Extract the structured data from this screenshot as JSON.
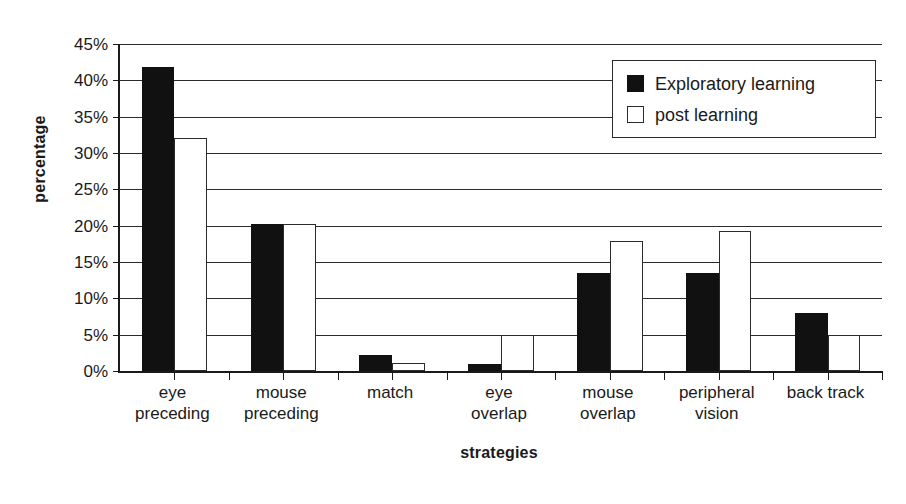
{
  "chart_data": {
    "type": "bar",
    "title": "",
    "xlabel": "strategies",
    "ylabel": "percentage",
    "categories": [
      "eye preceding",
      "mouse preceding",
      "match",
      "eye overlap",
      "mouse overlap",
      "peripheral vision",
      "back track"
    ],
    "category_lines": [
      [
        "eye",
        "preceding"
      ],
      [
        "mouse",
        "preceding"
      ],
      [
        "match",
        ""
      ],
      [
        "eye",
        "overlap"
      ],
      [
        "mouse",
        "overlap"
      ],
      [
        "peripheral",
        "vision"
      ],
      [
        "back track",
        ""
      ]
    ],
    "series": [
      {
        "name": "Exploratory learning",
        "color": "#111111",
        "style": "filled",
        "values": [
          41.8,
          20.3,
          2.2,
          1.0,
          13.5,
          13.5,
          8.0
        ]
      },
      {
        "name": "post learning",
        "color": "#ffffff",
        "style": "hollow",
        "values": [
          32.1,
          20.3,
          1.1,
          4.9,
          17.9,
          19.2,
          5.0
        ]
      }
    ],
    "ylim": [
      0,
      45
    ],
    "ytick_values": [
      0,
      5,
      10,
      15,
      20,
      25,
      30,
      35,
      40,
      45
    ],
    "ytick_labels": [
      "0%",
      "5%",
      "10%",
      "15%",
      "20%",
      "25%",
      "30%",
      "35%",
      "40%",
      "45%"
    ],
    "grid": true,
    "grid_axis": "y",
    "legend_position": "top-right"
  },
  "legend": {
    "entries": [
      {
        "label": "Exploratory learning",
        "swatch": "filled-square-icon"
      },
      {
        "label": "post learning",
        "swatch": "hollow-square-icon"
      }
    ]
  }
}
